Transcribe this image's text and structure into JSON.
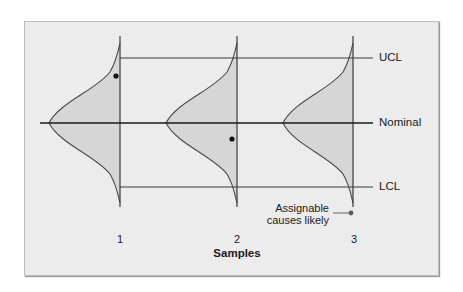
{
  "diagram": {
    "type": "control-chart-distributions",
    "limits": {
      "ucl_label": "UCL",
      "nominal_label": "Nominal",
      "lcl_label": "LCL"
    },
    "samples": {
      "axis_title": "Samples",
      "ticks": [
        "1",
        "2",
        "3"
      ]
    },
    "annotation": {
      "line1": "Assignable",
      "line2": "causes likely"
    },
    "colors": {
      "background": "#ececec",
      "curve_fill": "#d6d6d6",
      "line": "#3a3a3a",
      "annotation_dot": "#5a5a5a"
    },
    "data_points": [
      {
        "sample": "1",
        "position": "near UCL, inside distribution tail"
      },
      {
        "sample": "2",
        "position": "below nominal, inside distribution"
      }
    ]
  }
}
